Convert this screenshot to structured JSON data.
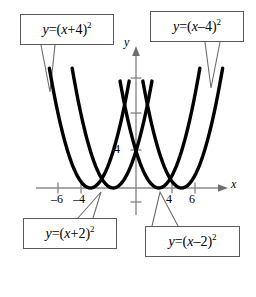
{
  "figure": {
    "title": "",
    "background_color": "#ffffff",
    "curve_color": "#000000",
    "axis_color": "#808080",
    "callout_border_color": "#5a5a5a"
  },
  "axes": {
    "x_axis_label": "x",
    "y_axis_label": "y",
    "x_tick_labels": [
      "–6",
      "–4",
      "4",
      "6"
    ],
    "x_tick_values": [
      -6,
      -4,
      4,
      6
    ],
    "y_tick_labels": [
      "4"
    ],
    "y_tick_values": [
      4
    ],
    "x_range": [
      -8,
      8
    ],
    "y_range": [
      -2,
      17
    ],
    "grid": false
  },
  "callouts": [
    {
      "id": "top-left",
      "text": "y = (x + 4)²",
      "lhs": "y",
      "equals": "=",
      "open_paren": "(",
      "var": "x",
      "operator": "+",
      "constant": "4",
      "close_paren": ")",
      "exponent": "2"
    },
    {
      "id": "top-right",
      "text": "y = (x – 4)²",
      "lhs": "y",
      "equals": "=",
      "open_paren": "(",
      "var": "x",
      "operator": "–",
      "constant": "4",
      "close_paren": ")",
      "exponent": "2"
    },
    {
      "id": "bottom-left",
      "text": "y = (x + 2)²",
      "lhs": "y",
      "equals": "=",
      "open_paren": "(",
      "var": "x",
      "operator": "+",
      "constant": "2",
      "close_paren": ")",
      "exponent": "2"
    },
    {
      "id": "bottom-right",
      "text": "y = (x – 2)²",
      "lhs": "y",
      "equals": "=",
      "open_paren": "(",
      "var": "x",
      "operator": "–",
      "constant": "2",
      "close_paren": ")",
      "exponent": "2"
    }
  ],
  "chart_data": {
    "type": "line",
    "title": "",
    "xlabel": "x",
    "ylabel": "y",
    "xlim": [
      -8,
      8
    ],
    "ylim": [
      -2,
      17
    ],
    "grid": false,
    "x_ticks": [
      -6,
      -4,
      4,
      6
    ],
    "x_tick_labels": [
      "–6",
      "–4",
      "4",
      "6"
    ],
    "y_ticks": [
      4,
      8,
      12
    ],
    "y_tick_labels": [
      "4",
      "",
      ""
    ],
    "legend": "callout boxes",
    "series": [
      {
        "name": "y = (x + 4)²",
        "equation": "y = (x + 4)^2",
        "vertex": [
          -4,
          0
        ],
        "color": "#000000",
        "x_domain": [
          -7.6,
          -0.6
        ]
      },
      {
        "name": "y = (x + 2)²",
        "equation": "y = (x + 2)^2",
        "vertex": [
          -2,
          0
        ],
        "color": "#000000",
        "x_domain": [
          -5.6,
          1.4
        ]
      },
      {
        "name": "y = (x – 2)²",
        "equation": "y = (x - 2)^2",
        "vertex": [
          2,
          0
        ],
        "color": "#000000",
        "x_domain": [
          -1.4,
          5.6
        ]
      },
      {
        "name": "y = (x – 4)²",
        "equation": "y = (x - 4)^2",
        "vertex": [
          4,
          0
        ],
        "color": "#000000",
        "x_domain": [
          0.6,
          7.6
        ]
      }
    ],
    "annotations": [
      "Four congruent upward parabolas, horizontal translations of y = x^2",
      "Vertices on the x-axis at x = -4, -2, 2, 4",
      "Adjacent pairs intersect at height y = 4 and y = 1"
    ]
  }
}
